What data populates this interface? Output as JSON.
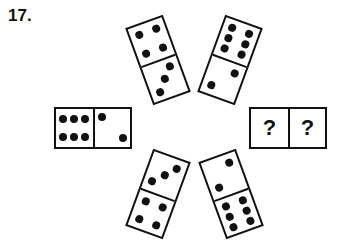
{
  "question": {
    "number": "17."
  },
  "dominoes": [
    {
      "position": "top-left",
      "halves": [
        4,
        3
      ],
      "rotation_deg": -20
    },
    {
      "position": "top-right",
      "halves": [
        6,
        2
      ],
      "rotation_deg": 20
    },
    {
      "position": "left",
      "halves": [
        6,
        2
      ],
      "rotation_deg": 0
    },
    {
      "position": "right",
      "halves": [
        "?",
        "?"
      ],
      "rotation_deg": 0
    },
    {
      "position": "bottom-left",
      "halves": [
        3,
        4
      ],
      "rotation_deg": 20
    },
    {
      "position": "bottom-right",
      "halves": [
        2,
        6
      ],
      "rotation_deg": -20
    }
  ],
  "unknown": {
    "left": "?",
    "right": "?"
  },
  "colors": {
    "ink": "#111111",
    "background": "#ffffff"
  }
}
